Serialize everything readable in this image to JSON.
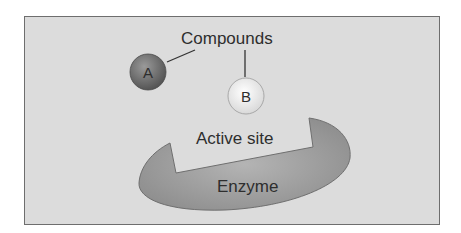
{
  "diagram": {
    "labels": {
      "compounds": "Compounds",
      "compound_a": "A",
      "compound_b": "B",
      "active_site": "Active site",
      "enzyme": "Enzyme"
    },
    "colors": {
      "background": "#dcdcdc",
      "enzyme_fill": "#9a9a9a",
      "compound_a_fill": "#6f6f6f",
      "compound_b_fill": "#f2f2f2",
      "border": "#6e6e6e"
    }
  }
}
